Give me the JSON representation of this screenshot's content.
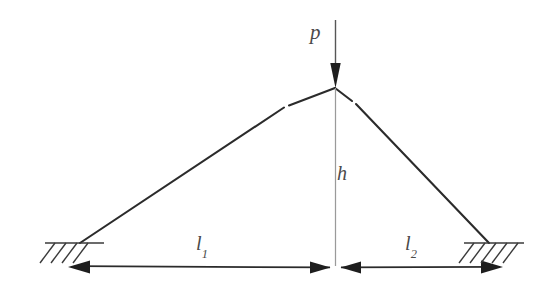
{
  "diagram": {
    "type": "engineering-schematic",
    "background_color": "#ffffff",
    "line_color": "#2b2b2b",
    "thin_line_color": "#8c8c8c",
    "label_color": "#4a4a4a",
    "labels": {
      "load": "p",
      "height": "h",
      "span_left_base": "l",
      "span_left_sub": "1",
      "span_right_base": "l",
      "span_right_sub": "2"
    },
    "geometry": {
      "apex": {
        "x": 335,
        "y": 88
      },
      "left_anchor": {
        "x": 80,
        "y": 243
      },
      "right_anchor": {
        "x": 489,
        "y": 243
      },
      "load_line": {
        "x": 335,
        "y_top": 20,
        "y_bottom": 88
      },
      "height_line": {
        "x": 335,
        "y_top": 88,
        "y_bottom": 267
      },
      "dimension_line_y": 267,
      "dimension_left": {
        "from_x": 336,
        "to_x": 68
      },
      "dimension_right": {
        "from_x": 336,
        "to_x": 503
      },
      "support_left": {
        "x1": 57,
        "x2": 104,
        "y": 243,
        "hatch_count": 4
      },
      "support_right": {
        "x1": 464,
        "x2": 521,
        "y": 243,
        "hatch_count": 5
      }
    },
    "elements": [
      "vertical-load-arrow",
      "left-cable",
      "right-cable",
      "height-line",
      "left-dimension-arrow",
      "right-dimension-arrow",
      "left-support-hatch",
      "right-support-hatch"
    ]
  }
}
